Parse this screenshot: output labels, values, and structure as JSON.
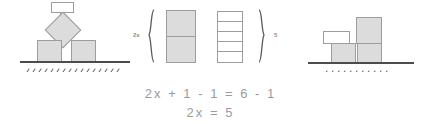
{
  "diagram": {
    "title_text": "",
    "colors": {
      "block_fill": "#dcdcdc",
      "block_stroke": "#9d9d9d",
      "empty_fill": "#ffffff",
      "ground_line": "#4c4c4c",
      "text": "#9b9b9b"
    },
    "left_figure": {
      "name": "balanced-blocks-left",
      "description_label": "",
      "parts": [
        {
          "shape": "rectangle",
          "fill": "white",
          "label": ""
        },
        {
          "shape": "diamond",
          "fill": "gray",
          "label": ""
        },
        {
          "shape": "square",
          "fill": "gray",
          "label": ""
        },
        {
          "shape": "square",
          "fill": "gray",
          "label": ""
        }
      ]
    },
    "middle_figure": {
      "left_tag": "2x",
      "right_tag": "5",
      "left_bar": {
        "fill": "gray",
        "segments": 2
      },
      "right_bar": {
        "fill": "white",
        "segments": 5
      }
    },
    "right_figure": {
      "name": "balanced-blocks-right",
      "parts": [
        {
          "shape": "rectangle",
          "fill": "white",
          "label": ""
        },
        {
          "shape": "rectangle",
          "fill": "gray",
          "label": ""
        },
        {
          "shape": "square",
          "fill": "gray",
          "label": ""
        },
        {
          "shape": "square",
          "fill": "gray",
          "label": ""
        }
      ]
    },
    "equations": {
      "line1": "2x + 1 - 1 = 6 - 1",
      "line2": "2x = 5"
    }
  }
}
